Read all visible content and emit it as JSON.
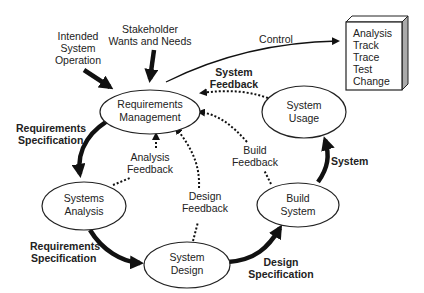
{
  "nodes": {
    "req_mgmt": {
      "line1": "Requirements",
      "line2": "Management"
    },
    "sys_usage": {
      "line1": "System",
      "line2": "Usage"
    },
    "sys_analysis": {
      "line1": "Systems",
      "line2": "Analysis"
    },
    "sys_design": {
      "line1": "System",
      "line2": "Design"
    },
    "build_system": {
      "line1": "Build",
      "line2": "System"
    }
  },
  "inputs": {
    "intended": {
      "line1": "Intended",
      "line2": "System",
      "line3": "Operation"
    },
    "stakeholder": {
      "line1": "Stakeholder",
      "line2": "Wants and Needs"
    }
  },
  "control_label": "Control",
  "control_box": {
    "items": [
      "Analysis",
      "Track",
      "Trace",
      "Test",
      "Change"
    ]
  },
  "flows": {
    "req_spec_1": {
      "line1": "Requirements",
      "line2": "Specification"
    },
    "req_spec_2": {
      "line1": "Requirements",
      "line2": "Specification"
    },
    "design_spec": {
      "line1": "Design",
      "line2": "Specification"
    },
    "system": "System"
  },
  "feedback": {
    "system": {
      "line1": "System",
      "line2": "Feedback"
    },
    "analysis": {
      "line1": "Analysis",
      "line2": "Feedback"
    },
    "design": {
      "line1": "Design",
      "line2": "Feedback"
    },
    "build": {
      "line1": "Build",
      "line2": "Feedback"
    }
  }
}
